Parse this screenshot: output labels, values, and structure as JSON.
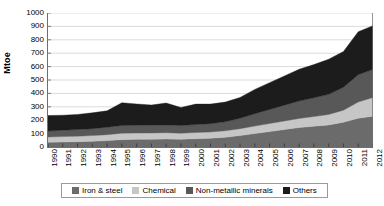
{
  "chart_data": {
    "type": "area",
    "stacked": true,
    "title": "",
    "xlabel": "",
    "ylabel": "Mtoe",
    "ylim": [
      0,
      1000
    ],
    "ytick_step": 100,
    "yticks": [
      0,
      100,
      200,
      300,
      400,
      500,
      600,
      700,
      800,
      900,
      1000
    ],
    "grid": true,
    "grid_axis": "y",
    "legend_position": "bottom",
    "categories": [
      "1990",
      "1991",
      "1992",
      "1993",
      "1994",
      "1995",
      "1996",
      "1997",
      "1998",
      "1999",
      "2000",
      "2001",
      "2002",
      "2003",
      "2004",
      "2005",
      "2006",
      "2007",
      "2008",
      "2009",
      "2010",
      "2011",
      "2012"
    ],
    "series": [
      {
        "name": "Iron & steel",
        "color": "#6b6b6b",
        "values": [
          35,
          37,
          40,
          43,
          48,
          55,
          57,
          58,
          60,
          58,
          62,
          65,
          72,
          85,
          100,
          115,
          130,
          145,
          155,
          165,
          185,
          215,
          230
        ]
      },
      {
        "name": "Chemical",
        "color": "#c6c6c6",
        "values": [
          40,
          41,
          41,
          42,
          44,
          48,
          47,
          47,
          47,
          45,
          46,
          47,
          49,
          52,
          56,
          60,
          64,
          68,
          72,
          78,
          90,
          120,
          140
        ]
      },
      {
        "name": "Non-metallic minerals",
        "color": "#585858",
        "values": [
          45,
          47,
          49,
          52,
          56,
          58,
          58,
          58,
          58,
          57,
          60,
          62,
          67,
          78,
          92,
          105,
          118,
          130,
          140,
          150,
          170,
          205,
          210
        ]
      },
      {
        "name": "Others",
        "color": "#1c1c1c",
        "values": [
          115,
          112,
          113,
          118,
          122,
          169,
          159,
          150,
          163,
          135,
          152,
          146,
          147,
          155,
          182,
          200,
          218,
          237,
          248,
          262,
          267,
          320,
          325
        ]
      }
    ],
    "totals": [
      235,
      237,
      243,
      255,
      270,
      330,
      321,
      313,
      328,
      295,
      320,
      320,
      335,
      370,
      430,
      480,
      530,
      580,
      615,
      655,
      712,
      860,
      905
    ]
  },
  "legend": {
    "items": [
      {
        "label": "Iron & steel",
        "color": "#6b6b6b"
      },
      {
        "label": "Chemical",
        "color": "#c6c6c6"
      },
      {
        "label": "Non-metallic minerals",
        "color": "#585858"
      },
      {
        "label": "Others",
        "color": "#1c1c1c"
      }
    ]
  }
}
